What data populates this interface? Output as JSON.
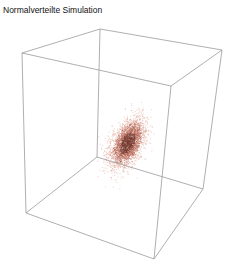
{
  "chart_data": {
    "type": "scatter3d",
    "title": "Normalverteilte Simulation",
    "xlabel": "",
    "ylabel": "",
    "zlabel": "",
    "axes_shown": false,
    "ticks_shown": false,
    "box": true,
    "box_color": "#9a9a9a",
    "point_colors": {
      "core": "#7a3a2e",
      "mid": "#b8604e",
      "outer": "#e0a090"
    },
    "distribution": "multivariate normal",
    "approx_point_count": 3000,
    "cloud_center_px": [
      127,
      143
    ],
    "cloud_orientation": "elongated along diagonal, tilted ~ -60deg",
    "cube_vertices_px": {
      "top_front_left": [
        22,
        53
      ],
      "top_back_left": [
        100,
        29
      ],
      "top_back_right": [
        222,
        50
      ],
      "top_front_right": [
        171,
        86
      ],
      "bottom_front_left": [
        26,
        213
      ],
      "bottom_back_left": [
        97,
        157
      ],
      "bottom_back_right": [
        203,
        189
      ],
      "bottom_front_right": [
        154,
        259
      ]
    }
  }
}
